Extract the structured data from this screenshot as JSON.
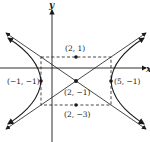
{
  "diagram": {
    "type": "hyperbola",
    "axes": {
      "x_label": "x",
      "y_label": "y"
    },
    "center": {
      "label": "(2, −1)"
    },
    "vertices": [
      {
        "label": "(−1, −1)"
      },
      {
        "label": "(5, −1)"
      }
    ],
    "co_vertices": [
      {
        "label": "(2, 1)"
      },
      {
        "label": "(2, −3)"
      }
    ],
    "colors": {
      "stroke": "#1a1a1a",
      "background": "#ffffff"
    }
  }
}
